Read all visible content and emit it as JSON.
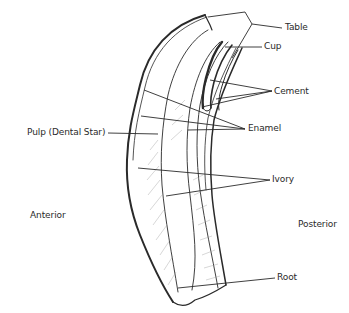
{
  "diagram": {
    "labels": {
      "table": "Table",
      "cup": "Cup",
      "cement": "Cement",
      "enamel": "Enamel",
      "pulp": "Pulp (Dental Star)",
      "ivory": "Ivory",
      "anterior": "Anterior",
      "posterior": "Posterior",
      "root": "Root"
    },
    "colors": {
      "ink": "#2a2a2a",
      "shading": "#9a9a9a",
      "background": "#ffffff"
    }
  }
}
